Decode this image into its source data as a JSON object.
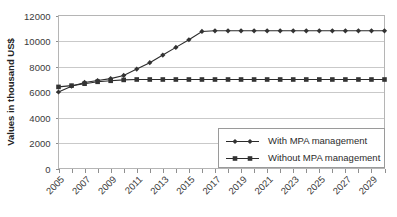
{
  "chart_data": {
    "type": "line",
    "title": "",
    "xlabel": "",
    "ylabel": "Values in thousand US$",
    "ylim": [
      0,
      12000
    ],
    "yticks": [
      0,
      2000,
      4000,
      6000,
      8000,
      10000,
      12000
    ],
    "ytick_labels": [
      "0",
      "2000",
      "4000",
      "6000",
      "8000",
      "10000",
      "12000"
    ],
    "grid": true,
    "legend_position": "lower-right",
    "x": [
      2005,
      2006,
      2007,
      2008,
      2009,
      2010,
      2011,
      2012,
      2013,
      2014,
      2015,
      2016,
      2017,
      2018,
      2019,
      2020,
      2021,
      2022,
      2023,
      2024,
      2025,
      2026,
      2027,
      2028,
      2029,
      2030
    ],
    "xtick_labels": [
      "2005",
      "2007",
      "2009",
      "2011",
      "2013",
      "2015",
      "2017",
      "2019",
      "2021",
      "2023",
      "2025",
      "2027",
      "2029"
    ],
    "xtick_label_values": [
      2005,
      2007,
      2009,
      2011,
      2013,
      2015,
      2017,
      2019,
      2021,
      2023,
      2025,
      2027,
      2029
    ],
    "series": [
      {
        "name": "With MPA management",
        "marker": "diamond",
        "color": "#333333",
        "values": [
          6000,
          6450,
          6750,
          6900,
          7050,
          7300,
          7800,
          8300,
          8900,
          9500,
          10100,
          10750,
          10800,
          10800,
          10800,
          10800,
          10800,
          10800,
          10800,
          10800,
          10800,
          10800,
          10800,
          10800,
          10800,
          10800
        ]
      },
      {
        "name": "Without MPA management",
        "marker": "square",
        "color": "#333333",
        "values": [
          6400,
          6500,
          6650,
          6800,
          6880,
          6950,
          6980,
          6980,
          6980,
          6980,
          6980,
          6980,
          6980,
          6980,
          6980,
          6980,
          6980,
          6980,
          6980,
          6980,
          6980,
          6980,
          6980,
          6980,
          6980,
          6980
        ]
      }
    ]
  },
  "legend": {
    "entries": [
      {
        "label": "With MPA management"
      },
      {
        "label": "Without MPA management"
      }
    ]
  }
}
